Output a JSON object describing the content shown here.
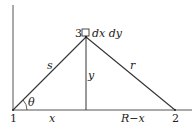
{
  "diagram": {
    "points": {
      "p1": "1",
      "p2": "2",
      "p3": "3"
    },
    "element_label": "dx dy",
    "segment_labels": {
      "s": "s",
      "r": "r",
      "y": "y",
      "x": "x",
      "r_minus_x": "R−x",
      "theta": "θ"
    },
    "colors": {
      "line": "#333333",
      "text": "#222222"
    }
  }
}
